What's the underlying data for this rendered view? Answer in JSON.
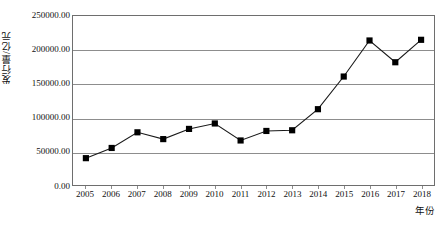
{
  "chart_data": {
    "type": "line",
    "title": "",
    "xlabel": "年份",
    "ylabel": "发行量/亿元",
    "categories": [
      2005,
      2006,
      2007,
      2008,
      2009,
      2010,
      2011,
      2012,
      2013,
      2014,
      2015,
      2016,
      2017,
      2018
    ],
    "x_tick_labels": [
      "2005",
      "2006",
      "2007",
      "2008",
      "2009",
      "2010",
      "2011",
      "2012",
      "2013",
      "2014",
      "2015",
      "2016",
      "2017",
      "2018"
    ],
    "values": [
      41000,
      56000,
      79000,
      69000,
      84000,
      92000,
      67000,
      81000,
      82000,
      113000,
      161000,
      214000,
      182000,
      215000
    ],
    "series": [
      {
        "name": "发行量",
        "values": [
          41000,
          56000,
          79000,
          69000,
          84000,
          92000,
          67000,
          81000,
          82000,
          113000,
          161000,
          214000,
          182000,
          215000
        ]
      }
    ],
    "ylim": [
      0,
      250000
    ],
    "y_ticks": [
      0,
      50000,
      100000,
      150000,
      200000,
      250000
    ],
    "y_tick_labels": [
      "0.00",
      "50000.00",
      "100000.00",
      "150000.00",
      "200000.00",
      "250000.00"
    ],
    "grid": "horizontal",
    "legend": "none",
    "marker": "filled-square",
    "line_color": "#1a1a1a",
    "marker_color": "#000000",
    "grid_color": "#8d8d8d"
  }
}
